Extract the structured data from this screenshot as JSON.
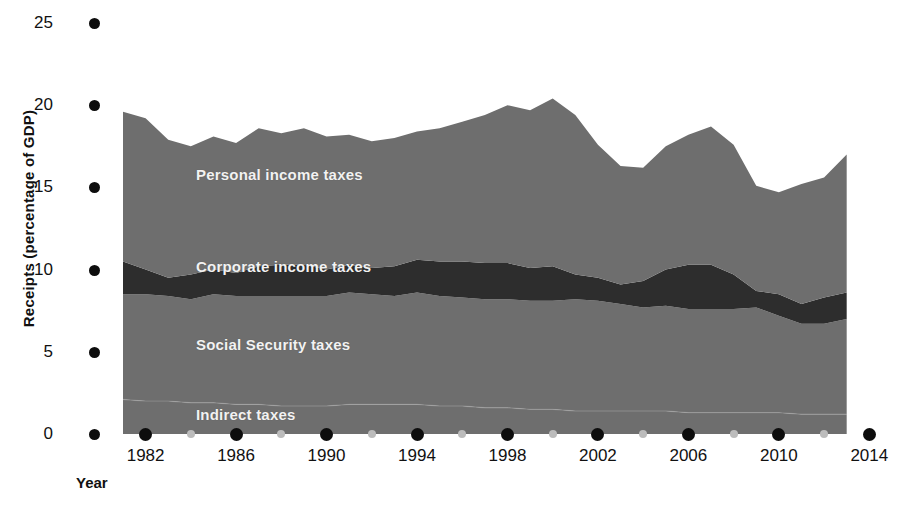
{
  "chart_data": {
    "type": "area",
    "stacked": true,
    "title": "",
    "xlabel": "Year",
    "ylabel": "Receipts (percentage of GDP)",
    "xlim": [
      1981,
      2013.5
    ],
    "ylim": [
      0,
      25
    ],
    "yticks": [
      0,
      5,
      10,
      15,
      20,
      25
    ],
    "ytick_labels": [
      "0",
      "5",
      "10",
      "15",
      "20",
      "25"
    ],
    "xticks_major": [
      1982,
      1986,
      1990,
      1994,
      1998,
      2002,
      2006,
      2010,
      2014
    ],
    "xtick_labels": [
      "1982",
      "1986",
      "1990",
      "1994",
      "1998",
      "2002",
      "2006",
      "2010",
      "2014"
    ],
    "xticks_minor": [
      1984,
      1988,
      1992,
      1996,
      2000,
      2004,
      2008,
      2012
    ],
    "grid": false,
    "legend_position": "inline",
    "x": [
      1981,
      1982,
      1983,
      1984,
      1985,
      1986,
      1987,
      1988,
      1989,
      1990,
      1991,
      1992,
      1993,
      1994,
      1995,
      1996,
      1997,
      1998,
      1999,
      2000,
      2001,
      2002,
      2003,
      2004,
      2005,
      2006,
      2007,
      2008,
      2009,
      2010,
      2011,
      2012,
      2013
    ],
    "series": [
      {
        "name": "Indirect taxes",
        "color": "#6e6e6e",
        "values": [
          2.1,
          2.0,
          2.0,
          1.9,
          1.9,
          1.8,
          1.8,
          1.7,
          1.7,
          1.7,
          1.8,
          1.8,
          1.8,
          1.8,
          1.7,
          1.7,
          1.6,
          1.6,
          1.5,
          1.5,
          1.4,
          1.4,
          1.4,
          1.4,
          1.4,
          1.3,
          1.3,
          1.3,
          1.3,
          1.3,
          1.2,
          1.2,
          1.2
        ]
      },
      {
        "name": "Social Security taxes",
        "color": "#6e6e6e",
        "values": [
          6.4,
          6.5,
          6.4,
          6.3,
          6.6,
          6.6,
          6.6,
          6.7,
          6.7,
          6.7,
          6.8,
          6.7,
          6.6,
          6.8,
          6.7,
          6.6,
          6.6,
          6.6,
          6.6,
          6.6,
          6.8,
          6.7,
          6.5,
          6.3,
          6.4,
          6.3,
          6.3,
          6.3,
          6.4,
          5.9,
          5.5,
          5.5,
          5.8
        ]
      },
      {
        "name": "Corporate income taxes",
        "color": "#2d2d2d",
        "values": [
          2.0,
          1.5,
          1.1,
          1.5,
          1.5,
          1.4,
          1.8,
          1.9,
          1.9,
          1.6,
          1.7,
          1.6,
          1.8,
          2.0,
          2.1,
          2.2,
          2.2,
          2.2,
          2.0,
          2.1,
          1.5,
          1.4,
          1.2,
          1.6,
          2.2,
          2.7,
          2.7,
          2.1,
          1.0,
          1.3,
          1.2,
          1.6,
          1.6
        ]
      },
      {
        "name": "Personal income taxes",
        "color": "#6e6e6e",
        "values": [
          9.1,
          9.2,
          8.4,
          7.8,
          8.1,
          7.9,
          8.4,
          8.0,
          8.3,
          8.1,
          7.9,
          7.7,
          7.8,
          7.8,
          8.1,
          8.5,
          9.0,
          9.6,
          9.6,
          10.2,
          9.7,
          8.1,
          7.2,
          6.9,
          7.5,
          7.9,
          8.4,
          7.9,
          6.4,
          6.2,
          7.3,
          7.3,
          8.4
        ]
      }
    ],
    "totals_note": "Total receipts peak near 21% of GDP around 2000 and trough near 15% in 2009."
  },
  "axis": {
    "y_title": "Receipts (percentage of GDP)",
    "x_title": "Year"
  },
  "series_labels": [
    {
      "text": "Personal income taxes",
      "left": 196,
      "top": 166
    },
    {
      "text": "Corporate income taxes",
      "left": 196,
      "top": 258
    },
    {
      "text": "Social Security taxes",
      "left": 196,
      "top": 336
    },
    {
      "text": "Indirect taxes",
      "left": 196,
      "top": 406
    }
  ],
  "colors": {
    "band_light": "#6e6e6e",
    "band_dark": "#2d2d2d",
    "tick_major": "#0d0d0d",
    "tick_minor": "#bcbcbc",
    "text": "#111111",
    "label_text": "#f2f2f2",
    "background": "#ffffff"
  }
}
